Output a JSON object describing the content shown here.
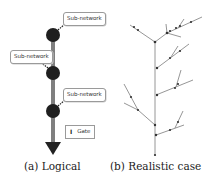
{
  "figure": {
    "panels": [
      {
        "id": "a",
        "caption": "(a) Logical",
        "callouts": [
          {
            "label": "Sub-network"
          },
          {
            "label": "Sub-network"
          },
          {
            "label": "Sub-network"
          }
        ],
        "legend": {
          "icon": "gate-icon",
          "glyph": "I",
          "label": "Gate"
        }
      },
      {
        "id": "b",
        "caption": "(b) Realistic case"
      }
    ],
    "colors": {
      "trunk": "#808080",
      "node": "#222222",
      "branch": "#8a8a8a",
      "text": "#222222"
    }
  }
}
